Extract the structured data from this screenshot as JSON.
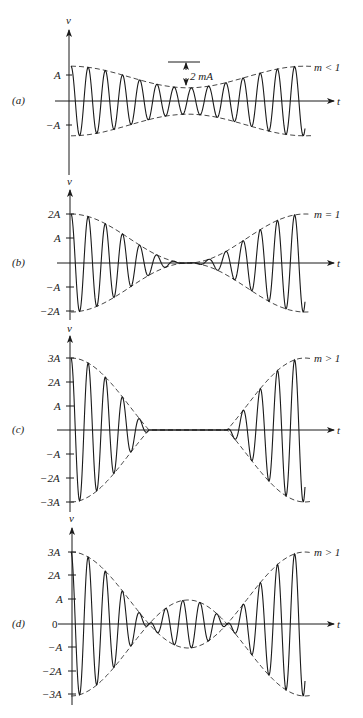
{
  "chart_data": [
    {
      "type": "line",
      "panel_label": "(a)",
      "condition": "m < 1",
      "xlabel": "t",
      "ylabel": "v",
      "yticks": [
        "A",
        "-A"
      ],
      "annotation": "2 mA",
      "m": 0.45,
      "envelope_max": 1.45,
      "envelope_min": 0.55,
      "description": "AM wave with modulation index less than 1; envelope never reaches zero"
    },
    {
      "type": "line",
      "panel_label": "(b)",
      "condition": "m = 1",
      "xlabel": "t",
      "ylabel": "v",
      "yticks": [
        "2A",
        "A",
        "-A",
        "-2A"
      ],
      "m": 1.0,
      "envelope_max": 2.0,
      "envelope_min": 0.0,
      "description": "AM wave with modulation index equal to 1; envelope just touches zero"
    },
    {
      "type": "line",
      "panel_label": "(c)",
      "condition": "m > 1",
      "xlabel": "t",
      "ylabel": "v",
      "yticks": [
        "3A",
        "2A",
        "A",
        "-A",
        "-2A",
        "-3A"
      ],
      "m": 2.0,
      "envelope_max": 3.0,
      "envelope_min": 0.0,
      "clipped": true,
      "description": "Overmodulated AM wave (m > 1) with envelope clipped to zero in the middle region"
    },
    {
      "type": "line",
      "panel_label": "(d)",
      "condition": "m > 1",
      "xlabel": "t",
      "ylabel": "v",
      "yticks": [
        "3A",
        "2A",
        "A",
        "0",
        "-A",
        "-2A",
        "-3A"
      ],
      "m": 2.0,
      "envelope_max": 3.0,
      "envelope_min": -1.0,
      "clipped": false,
      "description": "Overmodulated AM wave (m > 1) without clipping; envelope crosses zero causing phase reversal"
    }
  ],
  "labels": {
    "v": "v",
    "t": "t",
    "a": "(a)",
    "b": "(b)",
    "c": "(c)",
    "d": "(d)",
    "cond_a": "m < 1",
    "cond_b": "m = 1",
    "cond_c": "m > 1",
    "cond_d": "m > 1",
    "annot_a": "2 mA",
    "tick_A": "A",
    "tick_mA": "−A",
    "tick_2A": "2A",
    "tick_m2A": "−2A",
    "tick_3A": "3A",
    "tick_m3A": "−3A",
    "tick_0": "0"
  }
}
